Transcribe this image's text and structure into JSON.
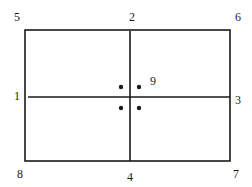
{
  "diagram": {
    "type": "rectangle-with-cross-and-points",
    "colors": {
      "stroke": "#1a1a1a",
      "background": "#ffffff"
    },
    "rect": {
      "x": 25,
      "y": 30,
      "width": 205,
      "height": 131,
      "stroke_width": 1.6
    },
    "cross": {
      "vertical": {
        "x": 130,
        "y1": 31,
        "y2": 161
      },
      "horizontal": {
        "y": 97,
        "x1": 28,
        "x2": 230
      }
    },
    "dots": [
      {
        "x": 121,
        "y": 87
      },
      {
        "x": 139,
        "y": 87
      },
      {
        "x": 121,
        "y": 108
      },
      {
        "x": 139,
        "y": 108
      }
    ],
    "labels": [
      {
        "id": "label-1",
        "text": "1",
        "x": 17,
        "y": 96,
        "position": "left-middle"
      },
      {
        "id": "label-2",
        "text": "2",
        "x": 132,
        "y": 17,
        "position": "top-middle"
      },
      {
        "id": "label-3",
        "text": "3",
        "x": 238,
        "y": 100,
        "position": "right-middle"
      },
      {
        "id": "label-4",
        "text": "4",
        "x": 130,
        "y": 177,
        "position": "bottom-middle"
      },
      {
        "id": "label-5",
        "text": "5",
        "x": 17,
        "y": 17,
        "position": "top-left"
      },
      {
        "id": "label-6",
        "text": "6",
        "x": 238,
        "y": 17,
        "position": "top-right"
      },
      {
        "id": "label-7",
        "text": "7",
        "x": 236,
        "y": 174,
        "position": "bottom-right"
      },
      {
        "id": "label-8",
        "text": "8",
        "x": 20,
        "y": 174,
        "position": "bottom-left"
      },
      {
        "id": "label-9",
        "text": "9",
        "x": 153,
        "y": 81,
        "position": "center-near-dots"
      }
    ]
  }
}
